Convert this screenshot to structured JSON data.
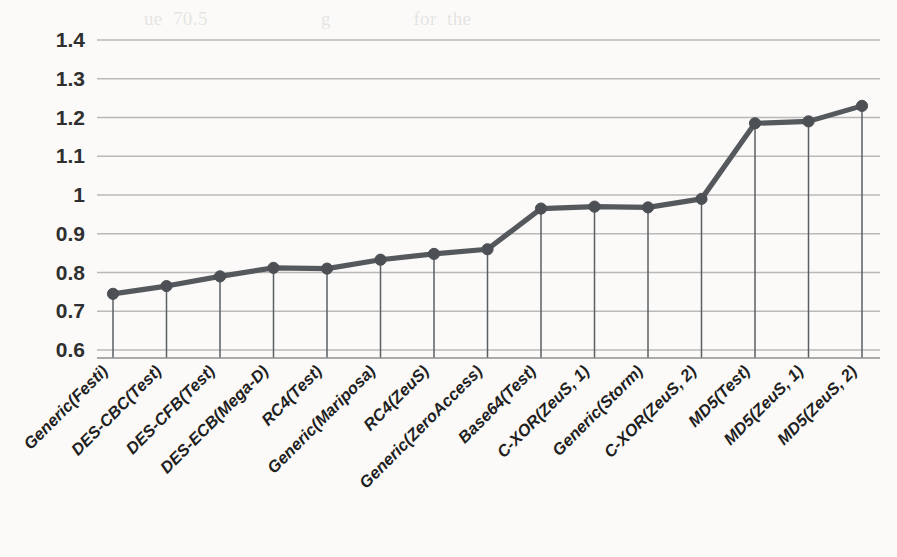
{
  "chart_data": {
    "type": "line",
    "title": "",
    "xlabel": "",
    "ylabel": "",
    "ylim": [
      0.6,
      1.4
    ],
    "ytick_labels": [
      "1.4",
      "1.3",
      "1.2",
      "1.1",
      "1",
      "0.9",
      "0.8",
      "0.7",
      "0.6"
    ],
    "ytick_values": [
      1.4,
      1.3,
      1.2,
      1.1,
      1.0,
      0.9,
      0.8,
      0.7,
      0.6
    ],
    "grid": true,
    "legend": "none",
    "drop_lines": true,
    "markers": "circle",
    "series_color": "#55595d",
    "gridline_color": "#b9b9b9",
    "categories": [
      "Generic(Festi)",
      "DES-CBC(Test)",
      "DES-CFB(Test)",
      "DES-ECB(Mega-D)",
      "RC4(Test)",
      "Generic(Mariposa)",
      "RC4(ZeuS)",
      "Generic(ZeroAccess)",
      "Base64(Test)",
      "C-XOR(ZeuS, 1)",
      "Generic(Storm)",
      "C-XOR(ZeuS, 2)",
      "MD5(Test)",
      "MD5(ZeuS, 1)",
      "MD5(ZeuS, 2)"
    ],
    "values": [
      0.745,
      0.765,
      0.79,
      0.812,
      0.81,
      0.833,
      0.848,
      0.86,
      0.965,
      0.97,
      0.968,
      0.99,
      1.185,
      1.19,
      1.23
    ]
  },
  "bleed_text": "                          ue  70.5                      g                for  the\n\n\n\n\n\n\n\n\n\n\n\n\n\n\n\n\n\n\n\n\n\n\n\n\n\n\n\n\n\n\n\n\n\n\n\n\n\n\n\n\n\n\n\n\n\n\n\n\n\n\n\n\n\n\n\n\n\n\n\n\n\n\n\n\n\n\n\n\n\n\n\n\n\n\n\n\n\n\n\n\n\n\n\n\n\n\n\n\n\n\n\n\n\n\n\n\n\n\n\n\n\n\n\n\n\n\n\n\n\n\n\n\n\n\n\n\n\n\n\n\n\n\n\n\n\n\nappears that the test data set is not as           the\nsets. It is interesting to note, however, that this infor-\nmation for the hash algorithms have been obtained\nfrom the     of the                \n\nand the malware    for all of them. It is    how-\never, also the case that the keys were     once"
}
